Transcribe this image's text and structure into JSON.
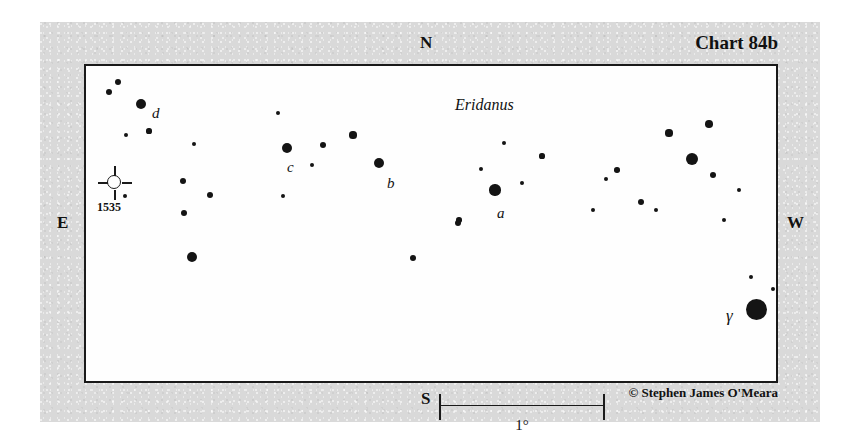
{
  "chart_data": {
    "type": "scatter",
    "title": "Chart 84b",
    "subtitle": "Eridanus",
    "credit": "© Stephen James O'Meara",
    "xlabel": "",
    "ylabel": "",
    "grid": false,
    "legend": "none",
    "field_box": {
      "left": 84,
      "top": 64,
      "width": 694,
      "height": 319
    },
    "cardinals": {
      "north": "N",
      "south": "S",
      "east": "E",
      "west": "W"
    },
    "scale_bar": {
      "label": "1°",
      "left": 353,
      "right": 519,
      "length_px": 166
    },
    "colors": {
      "star": "#141414",
      "frame": "#1a1a1a",
      "field": "#fefefe",
      "paper": "#d9d9d9"
    },
    "stars": [
      {
        "x": 118,
        "y": 82,
        "r": 3.2,
        "label": ""
      },
      {
        "x": 109,
        "y": 92,
        "r": 3.2,
        "label": ""
      },
      {
        "x": 141,
        "y": 104,
        "r": 5.0,
        "label": "d"
      },
      {
        "x": 126,
        "y": 135,
        "r": 2.0,
        "label": ""
      },
      {
        "x": 149,
        "y": 131,
        "r": 2.6,
        "label": ""
      },
      {
        "x": 194,
        "y": 144,
        "r": 2.2,
        "label": ""
      },
      {
        "x": 278,
        "y": 113,
        "r": 2.2,
        "label": ""
      },
      {
        "x": 183,
        "y": 181,
        "r": 3.4,
        "label": ""
      },
      {
        "x": 210,
        "y": 195,
        "r": 3.0,
        "label": ""
      },
      {
        "x": 184,
        "y": 213,
        "r": 3.2,
        "label": ""
      },
      {
        "x": 192,
        "y": 257,
        "r": 5.0,
        "label": ""
      },
      {
        "x": 287,
        "y": 148,
        "r": 5.0,
        "label": "c"
      },
      {
        "x": 312,
        "y": 165,
        "r": 2.2,
        "label": ""
      },
      {
        "x": 323,
        "y": 145,
        "r": 3.4,
        "label": ""
      },
      {
        "x": 353,
        "y": 135,
        "r": 3.6,
        "label": ""
      },
      {
        "x": 379,
        "y": 163,
        "r": 5.0,
        "label": "b"
      },
      {
        "x": 283,
        "y": 196,
        "r": 2.2,
        "label": ""
      },
      {
        "x": 413,
        "y": 258,
        "r": 3.0,
        "label": ""
      },
      {
        "x": 458,
        "y": 223,
        "r": 3.0,
        "label": ""
      },
      {
        "x": 504,
        "y": 143,
        "r": 2.2,
        "label": ""
      },
      {
        "x": 542,
        "y": 156,
        "r": 2.6,
        "label": ""
      },
      {
        "x": 481,
        "y": 169,
        "r": 2.2,
        "label": ""
      },
      {
        "x": 495,
        "y": 190,
        "r": 5.6,
        "label": "a"
      },
      {
        "x": 522,
        "y": 183,
        "r": 2.4,
        "label": ""
      },
      {
        "x": 459,
        "y": 220,
        "r": 2.8,
        "label": ""
      },
      {
        "x": 593,
        "y": 210,
        "r": 2.2,
        "label": ""
      },
      {
        "x": 709,
        "y": 124,
        "r": 3.8,
        "label": ""
      },
      {
        "x": 669,
        "y": 133,
        "r": 3.6,
        "label": ""
      },
      {
        "x": 692,
        "y": 159,
        "r": 6.4,
        "label": ""
      },
      {
        "x": 617,
        "y": 170,
        "r": 2.8,
        "label": ""
      },
      {
        "x": 606,
        "y": 179,
        "r": 2.2,
        "label": ""
      },
      {
        "x": 713,
        "y": 175,
        "r": 3.4,
        "label": ""
      },
      {
        "x": 739,
        "y": 190,
        "r": 2.4,
        "label": ""
      },
      {
        "x": 641,
        "y": 202,
        "r": 3.4,
        "label": ""
      },
      {
        "x": 656,
        "y": 210,
        "r": 2.4,
        "label": ""
      },
      {
        "x": 724,
        "y": 220,
        "r": 2.4,
        "label": ""
      },
      {
        "x": 751,
        "y": 277,
        "r": 2.4,
        "label": ""
      },
      {
        "x": 773,
        "y": 289,
        "r": 2.2,
        "label": ""
      },
      {
        "x": 756,
        "y": 309,
        "r": 10.5,
        "label": "γ"
      },
      {
        "x": 125,
        "y": 196,
        "r": 2.0,
        "label": ""
      }
    ],
    "star_labels": [
      {
        "text": "d",
        "x": 152,
        "y": 106,
        "style": "italic"
      },
      {
        "text": "c",
        "x": 287,
        "y": 160,
        "style": "italic"
      },
      {
        "text": "b",
        "x": 387,
        "y": 176,
        "style": "italic"
      },
      {
        "text": "a",
        "x": 497,
        "y": 206,
        "style": "italic"
      },
      {
        "text": "γ",
        "x": 726,
        "y": 307,
        "style": "greek"
      }
    ],
    "deep_sky_objects": [
      {
        "name": "1535",
        "symbol": "planetary-nebula",
        "x": 115,
        "y": 183,
        "label": "1535",
        "label_x": 97,
        "label_y": 201
      }
    ]
  }
}
